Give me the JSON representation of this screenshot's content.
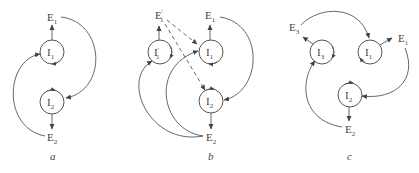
{
  "panels": [
    {
      "caption": "a",
      "nodes": {
        "E1": {
          "base": "E",
          "sub": "1"
        },
        "I1": {
          "base": "I",
          "sub": "1"
        },
        "I2": {
          "base": "I",
          "sub": "2"
        },
        "E2": {
          "base": "E",
          "sub": "2"
        }
      }
    },
    {
      "caption": "b",
      "nodes": {
        "E1p": {
          "base": "E",
          "sub": "1",
          "sup": "'"
        },
        "I1p": {
          "base": "I",
          "sub": "1",
          "sup": "'"
        },
        "E1": {
          "base": "E",
          "sub": "1"
        },
        "I1": {
          "base": "I",
          "sub": "1"
        },
        "I2": {
          "base": "I",
          "sub": "2"
        },
        "E2": {
          "base": "E",
          "sub": "2"
        }
      }
    },
    {
      "caption": "c",
      "nodes": {
        "E3": {
          "base": "E",
          "sub": "3"
        },
        "I3": {
          "base": "I",
          "sub": "3"
        },
        "I1": {
          "base": "I",
          "sub": "1"
        },
        "E1": {
          "base": "E",
          "sub": "1"
        },
        "I2": {
          "base": "I",
          "sub": "2"
        },
        "E2": {
          "base": "E",
          "sub": "2"
        }
      }
    }
  ],
  "colors": {
    "stroke": "#555555",
    "text": "#444444",
    "background": "#ffffff"
  }
}
